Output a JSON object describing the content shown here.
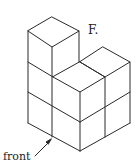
{
  "diagram": {
    "type": "isometric-cube-structure",
    "option_label": "F.",
    "direction_label": "front",
    "stroke_color": "#2a2a2a",
    "cubes": [
      {
        "position": "back-left column",
        "height": 3
      },
      {
        "position": "front",
        "height": 2
      },
      {
        "position": "right",
        "height": 2
      }
    ]
  }
}
